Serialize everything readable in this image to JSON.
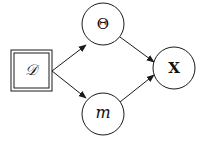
{
  "diagram": {
    "type": "graphical-model",
    "colors": {
      "stroke": "#1a1a1a",
      "fill": "#ffffff",
      "text": "#111111"
    },
    "nodes": [
      {
        "id": "D",
        "label": "𝒟",
        "shape": "double-square",
        "observed": true,
        "cx": 31,
        "cy": 70,
        "size": 41
      },
      {
        "id": "Theta",
        "label": "Θ",
        "shape": "circle",
        "cx": 103,
        "cy": 24,
        "r": 21
      },
      {
        "id": "m",
        "label": "m",
        "shape": "circle",
        "cx": 103,
        "cy": 114,
        "r": 21
      },
      {
        "id": "X",
        "label": "X",
        "shape": "circle",
        "cx": 174,
        "cy": 68,
        "r": 21
      }
    ],
    "edges": [
      {
        "from": "D",
        "to": "Theta"
      },
      {
        "from": "D",
        "to": "m"
      },
      {
        "from": "Theta",
        "to": "X"
      },
      {
        "from": "m",
        "to": "X"
      }
    ]
  }
}
